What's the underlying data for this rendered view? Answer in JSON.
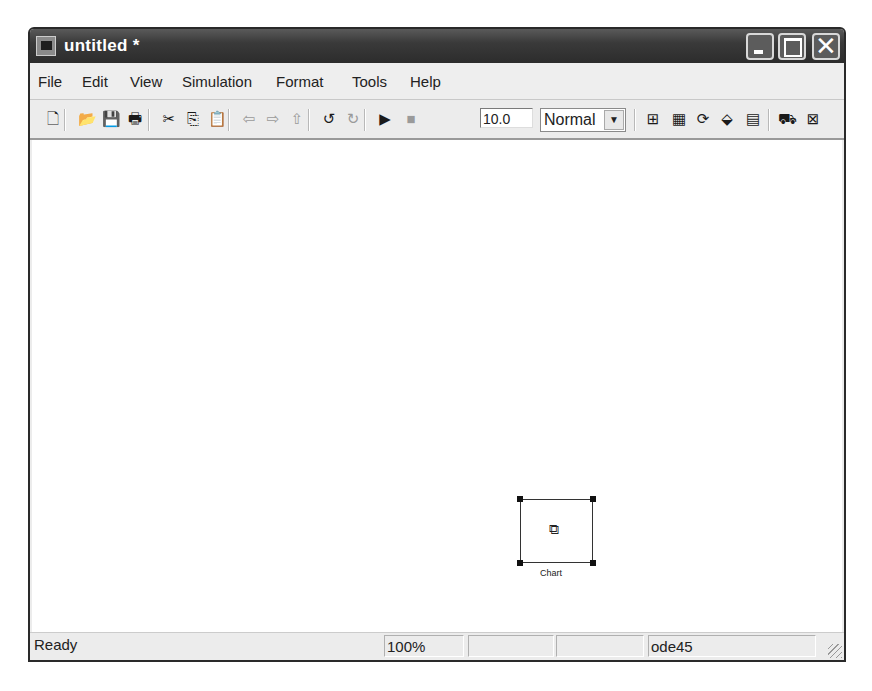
{
  "window": {
    "title": "untitled *",
    "controls": {
      "minimize": "_",
      "maximize": "□",
      "close": "✕"
    }
  },
  "menu": [
    {
      "label": "File",
      "x": 8
    },
    {
      "label": "Edit",
      "x": 52
    },
    {
      "label": "View",
      "x": 100
    },
    {
      "label": "Simulation",
      "x": 152
    },
    {
      "label": "Format",
      "x": 246
    },
    {
      "label": "Tools",
      "x": 322
    },
    {
      "label": "Help",
      "x": 380
    }
  ],
  "toolbar": {
    "buttons": [
      {
        "name": "new-model",
        "glyph": "🗋",
        "x": 14,
        "enabled": true
      },
      {
        "name": "open",
        "glyph": "📂",
        "x": 48,
        "enabled": true
      },
      {
        "name": "save",
        "glyph": "💾",
        "x": 72,
        "enabled": true
      },
      {
        "name": "print",
        "glyph": "🖶",
        "x": 96,
        "enabled": true
      },
      {
        "name": "cut",
        "glyph": "✂",
        "x": 130,
        "enabled": true
      },
      {
        "name": "copy",
        "glyph": "⎘",
        "x": 154,
        "enabled": true
      },
      {
        "name": "paste",
        "glyph": "📋",
        "x": 178,
        "enabled": false
      },
      {
        "name": "back",
        "glyph": "⇦",
        "x": 210,
        "enabled": false
      },
      {
        "name": "forward",
        "glyph": "⇨",
        "x": 234,
        "enabled": false
      },
      {
        "name": "up",
        "glyph": "⇧",
        "x": 258,
        "enabled": false
      },
      {
        "name": "undo",
        "glyph": "↺",
        "x": 290,
        "enabled": true
      },
      {
        "name": "redo",
        "glyph": "↻",
        "x": 314,
        "enabled": false
      },
      {
        "name": "start-simulation",
        "glyph": "▶",
        "x": 346,
        "enabled": true
      },
      {
        "name": "stop-simulation",
        "glyph": "■",
        "x": 372,
        "enabled": false
      },
      {
        "name": "build",
        "glyph": "⊞",
        "x": 614,
        "enabled": true
      },
      {
        "name": "update-diagram",
        "glyph": "▦",
        "x": 640,
        "enabled": true
      },
      {
        "name": "refresh",
        "glyph": "⟳",
        "x": 664,
        "enabled": true
      },
      {
        "name": "library-browser",
        "glyph": "⬙",
        "x": 688,
        "enabled": true
      },
      {
        "name": "model-explorer",
        "glyph": "▤",
        "x": 714,
        "enabled": true
      },
      {
        "name": "debugger",
        "glyph": "⛟",
        "x": 748,
        "enabled": true
      },
      {
        "name": "model-advisor",
        "glyph": "⊠",
        "x": 774,
        "enabled": true
      }
    ],
    "separators": [
      34,
      118,
      198,
      278,
      334,
      604,
      738
    ],
    "stop_time": "10.0",
    "sim_mode": "Normal"
  },
  "canvas": {
    "block": {
      "label": "Chart",
      "icon": "stateflow-chart-icon",
      "glyph": "⧉"
    }
  },
  "status": {
    "state": "Ready",
    "zoom": "100%",
    "solver": "ode45"
  }
}
